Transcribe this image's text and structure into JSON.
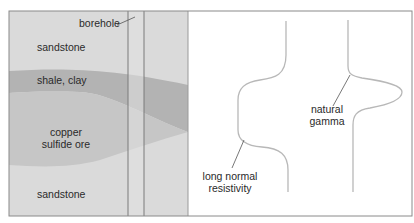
{
  "diagram": {
    "strata": [
      {
        "id": "sandstone-top",
        "label": "sandstone",
        "color": "#dadada"
      },
      {
        "id": "shale-clay",
        "label": "shale, clay",
        "color": "#b3b3b3"
      },
      {
        "id": "copper-ore",
        "label_line1": "copper",
        "label_line2": "sulfide ore",
        "color": "#c6c6c6"
      },
      {
        "id": "sandstone-bottom",
        "label": "sandstone",
        "color": "#dadada"
      }
    ],
    "borehole": {
      "label": "borehole",
      "color": "#e2e2e2"
    },
    "logs": {
      "resistivity": {
        "label_line1": "long normal",
        "label_line2": "resistivity"
      },
      "gamma": {
        "label_line1": "natural",
        "label_line2": "gamma"
      }
    },
    "colors": {
      "frame": "#8a8a8a",
      "curve": "#b8b8b8",
      "leader": "#555555",
      "text": "#2a2a2a"
    }
  }
}
